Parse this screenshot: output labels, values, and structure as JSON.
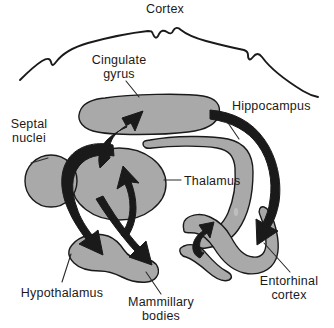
{
  "figure": {
    "canvas": {
      "width": 334,
      "height": 328
    },
    "background_color": "#ffffff",
    "structure_fill_color": "#a9a9a9",
    "outline_color": "#1a1a1a",
    "arrow_color": "#1a1a1a"
  },
  "labels": {
    "cortex": "Cortex",
    "cingulate_gyrus_line1": "Cingulate",
    "cingulate_gyrus_line2": "gyrus",
    "septal_nuclei_line1": "Septal",
    "septal_nuclei_line2": "nuclei",
    "hippocampus": "Hippocampus",
    "thalamus": "Thalamus",
    "hypothalamus": "Hypothalamus",
    "mammillary_bodies_line1": "Mammillary",
    "mammillary_bodies_line2": "bodies",
    "entorhinal_cortex_line1": "Entorhinal",
    "entorhinal_cortex_line2": "cortex"
  },
  "structures": [
    {
      "name": "cortex-outline",
      "kind": "wavy-line",
      "label_key": "cortex"
    },
    {
      "name": "cingulate-gyrus",
      "kind": "rounded-bar",
      "label_key": "cingulate_gyrus_line1"
    },
    {
      "name": "septal-nuclei",
      "kind": "circle",
      "label_key": "septal_nuclei_line1"
    },
    {
      "name": "thalamus",
      "kind": "ellipse",
      "label_key": "thalamus"
    },
    {
      "name": "hippocampus",
      "kind": "curved-band",
      "label_key": "hippocampus"
    },
    {
      "name": "entorhinal-cortex",
      "kind": "curved-band",
      "label_key": "entorhinal_cortex_line1"
    },
    {
      "name": "hypothalamus-mammillary-blob",
      "kind": "lobed-blob",
      "label_key": "hypothalamus"
    }
  ],
  "arrows": [
    {
      "name": "arrow-to-cingulate-gyrus",
      "direction": "up"
    },
    {
      "name": "arrow-to-thalamus",
      "direction": "up"
    },
    {
      "name": "arrow-hippocampus-to-entorhinal",
      "direction": "down-right"
    },
    {
      "name": "arrow-entorhinal-to-hippocampus",
      "direction": "up"
    },
    {
      "name": "arrow-septal-to-hypothalamus",
      "direction": "down"
    },
    {
      "name": "arrow-to-mammillary-bodies",
      "direction": "down-right"
    }
  ]
}
